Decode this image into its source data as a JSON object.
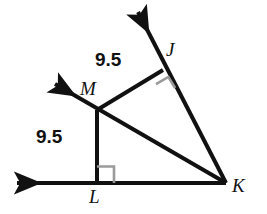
{
  "diagram": {
    "type": "geometry-figure",
    "stroke_color": "#111111",
    "right_angle_color": "#9a9a9a",
    "background_color": "#ffffff",
    "points": {
      "J": {
        "label": "J",
        "x": 163,
        "y": 70,
        "label_x": 166,
        "label_y": 40
      },
      "M": {
        "label": "M",
        "x": 97,
        "y": 110,
        "label_x": 80,
        "label_y": 79
      },
      "L": {
        "label": "L",
        "x": 97,
        "y": 183,
        "label_x": 89,
        "label_y": 187
      },
      "K": {
        "label": "K",
        "x": 226,
        "y": 183,
        "label_x": 232,
        "label_y": 176
      }
    },
    "measures": [
      {
        "name": "MJ",
        "value": "9.5",
        "label_x": 95,
        "label_y": 50
      },
      {
        "name": "ML",
        "value": "9.5",
        "label_x": 36,
        "label_y": 127
      }
    ],
    "segments": [
      {
        "name": "MJ",
        "from": "M",
        "to": "J"
      },
      {
        "name": "MK",
        "from": "M",
        "to": "K"
      },
      {
        "name": "ML",
        "from": "M",
        "to": "L"
      },
      {
        "name": "LK",
        "from": "L",
        "to": "K"
      },
      {
        "name": "JK",
        "from": "J",
        "to": "K"
      }
    ],
    "rays": [
      {
        "name": "ray-KJ-extended",
        "from_x": 163,
        "from_y": 70,
        "to_x": 133,
        "to_y": 8,
        "arrow": "up-right-origin"
      },
      {
        "name": "ray-KM-extended",
        "from_x": 97,
        "from_y": 110,
        "to_x": 50,
        "to_y": 81,
        "arrow": "up-left"
      },
      {
        "name": "ray-KL-extended",
        "from_x": 97,
        "from_y": 183,
        "to_x": 12,
        "to_y": 183,
        "arrow": "left"
      }
    ],
    "right_angles": [
      {
        "name": "right-angle-at-J",
        "vertex": "J"
      },
      {
        "name": "right-angle-at-L",
        "vertex": "L"
      }
    ]
  }
}
